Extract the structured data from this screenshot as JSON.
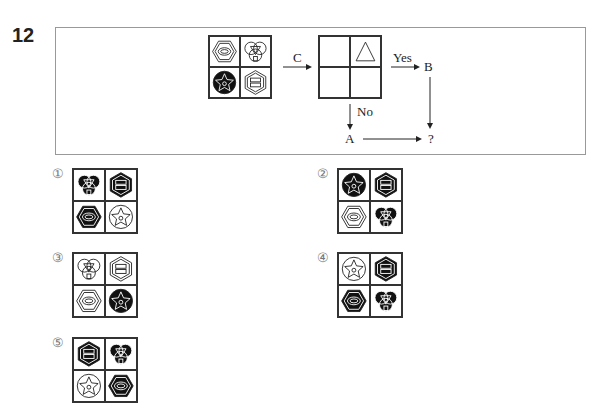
{
  "question": {
    "number": "12",
    "source_grid": [
      "hexagon-ellipse",
      "trefoil-circles",
      "filled-circle-star",
      "hexagon-bars"
    ],
    "source_grid_fill": [
      false,
      false,
      true,
      false
    ],
    "flow": {
      "arrow_c_label": "C",
      "yes_label": "Yes",
      "no_label": "No",
      "node_b": "B",
      "node_a": "A",
      "result": "?",
      "condition_grid": [
        "",
        "triangle",
        "",
        ""
      ]
    }
  },
  "options": [
    {
      "label": "①",
      "cells": [
        "trefoil-circles",
        "hexagon-bars",
        "hexagon-ellipse",
        "filled-circle-star"
      ],
      "fill": [
        true,
        true,
        true,
        false
      ]
    },
    {
      "label": "②",
      "cells": [
        "filled-circle-star",
        "hexagon-bars",
        "hexagon-ellipse",
        "trefoil-circles"
      ],
      "fill": [
        true,
        true,
        false,
        true
      ]
    },
    {
      "label": "③",
      "cells": [
        "trefoil-circles",
        "hexagon-bars",
        "hexagon-ellipse",
        "filled-circle-star"
      ],
      "fill": [
        false,
        false,
        false,
        true
      ]
    },
    {
      "label": "④",
      "cells": [
        "filled-circle-star",
        "hexagon-bars",
        "hexagon-ellipse",
        "trefoil-circles"
      ],
      "fill": [
        false,
        true,
        true,
        true
      ]
    },
    {
      "label": "⑤",
      "cells": [
        "hexagon-bars",
        "trefoil-circles",
        "filled-circle-star",
        "hexagon-ellipse"
      ],
      "fill": [
        true,
        true,
        false,
        true
      ]
    }
  ]
}
